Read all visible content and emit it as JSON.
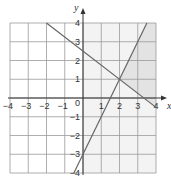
{
  "chart_data": {
    "type": "line",
    "title": "",
    "xlabel": "x",
    "ylabel": "y",
    "xlim": [
      -4,
      4
    ],
    "ylim": [
      -4,
      4
    ],
    "grid": true,
    "x_ticks": [
      "-4",
      "-3",
      "-2",
      "-1",
      "1",
      "2",
      "3",
      "4"
    ],
    "y_ticks": [
      "4",
      "3",
      "2",
      "1",
      "-1",
      "-2",
      "-3",
      "-4"
    ],
    "origin_label": "0",
    "series": [
      {
        "name": "line-rising",
        "equation": "y = 2x - 3",
        "points": [
          [
            -0.5,
            -4
          ],
          [
            3.5,
            4
          ]
        ]
      },
      {
        "name": "line-falling",
        "equation": "y = -0.75x + 2.5",
        "points": [
          [
            -2,
            4
          ],
          [
            4,
            -0.5
          ]
        ]
      }
    ],
    "intersection": [
      2,
      1
    ],
    "shaded_regions": [
      {
        "name": "light",
        "description": "x >= 0",
        "color": "#f3f3f3"
      },
      {
        "name": "dark",
        "description": "right of y=2x-3, above y=-0.75x+2.5, x<=4",
        "color": "#e4e4e4"
      }
    ]
  },
  "colors": {
    "grid": "#9a9a9a",
    "axis": "#333333",
    "line": "#666666",
    "light_shade": "#f3f3f3",
    "dark_shade": "#e3e3e3"
  }
}
